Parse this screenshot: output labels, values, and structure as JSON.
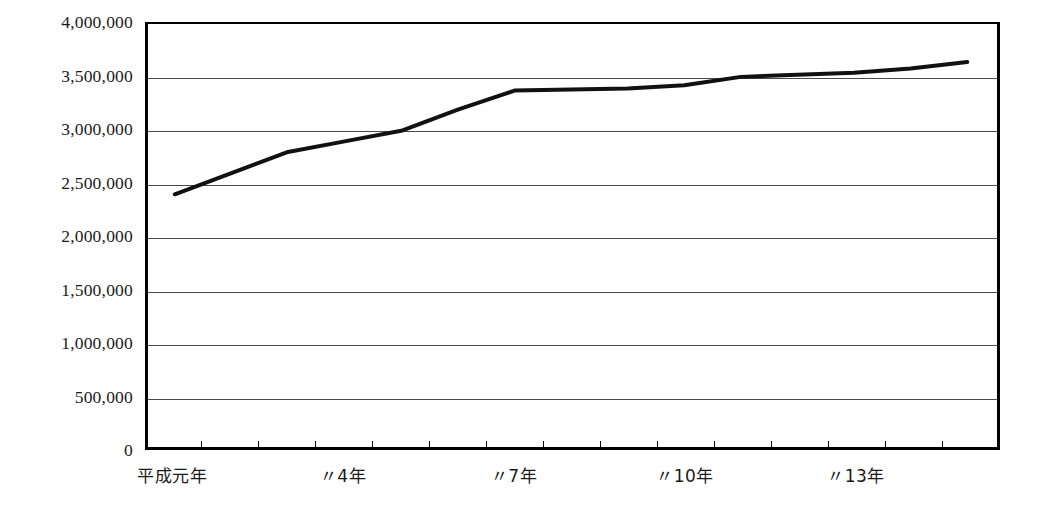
{
  "chart_data": {
    "type": "line",
    "title": "",
    "subtitle": "",
    "xlabel": "",
    "ylabel": "",
    "ylim": [
      0,
      4000000
    ],
    "y_ticks": [
      0,
      500000,
      1000000,
      1500000,
      2000000,
      2500000,
      3000000,
      3500000,
      4000000
    ],
    "y_tick_labels": [
      "0",
      "500,000",
      "1,000,000",
      "1,500,000",
      "2,000,000",
      "2,500,000",
      "3,000,000",
      "3,500,000",
      "4,000,000"
    ],
    "grid": true,
    "legend": "none",
    "x": [
      1,
      2,
      3,
      4,
      5,
      6,
      7,
      8,
      9,
      10,
      11,
      12,
      13,
      14,
      15
    ],
    "x_tick_labels": [
      "平成元年",
      "〃4年",
      "〃7年",
      "〃10年",
      "〃13年"
    ],
    "x_tick_label_positions": [
      1,
      4,
      7,
      10,
      13
    ],
    "series": [
      {
        "name": "",
        "color": "#111111",
        "values": [
          2390000,
          2590000,
          2790000,
          2890000,
          2990000,
          3190000,
          3370000,
          3380000,
          3390000,
          3420000,
          3500000,
          3520000,
          3540000,
          3580000,
          3640000
        ]
      }
    ]
  },
  "axis": {
    "y_labels": [
      "4,000,000",
      "3,500,000",
      "3,000,000",
      "2,500,000",
      "2,000,000",
      "1,500,000",
      "1,000,000",
      "500,000",
      "0"
    ],
    "x_labels": [
      "平成元年",
      "〃4年",
      "〃7年",
      "〃10年",
      "〃13年"
    ]
  },
  "style": {
    "line_color": "#111111",
    "grid_color": "#4a4a4a",
    "frame_color": "#000000",
    "background": "#ffffff"
  }
}
